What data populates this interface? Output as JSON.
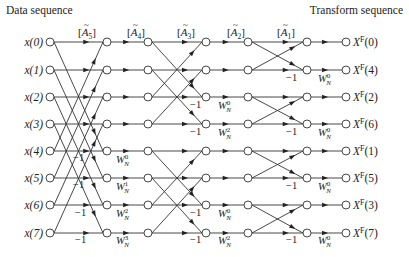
{
  "header": {
    "left_title": "Data sequence",
    "right_title": "Transform sequence"
  },
  "layout": {
    "columns_x": [
      50,
      107,
      148,
      206,
      248,
      307,
      346
    ],
    "rows_y": [
      42,
      70,
      97,
      124,
      151,
      178,
      205,
      233
    ],
    "node_radius": 4
  },
  "inputs": [
    "x(0)",
    "x(1)",
    "x(2)",
    "x(3)",
    "x(4)",
    "x(5)",
    "x(6)",
    "x(7)"
  ],
  "outputs": [
    {
      "base": "X",
      "sup": "F",
      "idx": "(0)"
    },
    {
      "base": "X",
      "sup": "F",
      "idx": "(4)"
    },
    {
      "base": "X",
      "sup": "F",
      "idx": "(2)"
    },
    {
      "base": "X",
      "sup": "F",
      "idx": "(6)"
    },
    {
      "base": "X",
      "sup": "F",
      "idx": "(1)"
    },
    {
      "base": "X",
      "sup": "F",
      "idx": "(5)"
    },
    {
      "base": "X",
      "sup": "F",
      "idx": "(3)"
    },
    {
      "base": "X",
      "sup": "F",
      "idx": "(7)"
    }
  ],
  "stage_labels": [
    {
      "text": "A",
      "sub": "5",
      "x": 78,
      "y": 36
    },
    {
      "text": "A",
      "sub": "4",
      "x": 127,
      "y": 36
    },
    {
      "text": "A",
      "sub": "3",
      "x": 177,
      "y": 36
    },
    {
      "text": "A",
      "sub": "2",
      "x": 227,
      "y": 36
    },
    {
      "text": "A",
      "sub": "1",
      "x": 277,
      "y": 36
    }
  ],
  "stages": [
    {
      "name": "stage-A5",
      "from_col": 0,
      "to_col": 1,
      "span": 4
    },
    {
      "name": "stage-A4",
      "from_col": 1,
      "to_col": 2,
      "span": 0
    },
    {
      "name": "stage-A3",
      "from_col": 2,
      "to_col": 3,
      "span": 2
    },
    {
      "name": "stage-A2",
      "from_col": 3,
      "to_col": 4,
      "span": 0
    },
    {
      "name": "stage-A1",
      "from_col": 4,
      "to_col": 5,
      "span": 1
    },
    {
      "name": "stage-out",
      "from_col": 5,
      "to_col": 6,
      "span": 0
    }
  ],
  "edge_labels": [
    {
      "text": "-1",
      "x": 73,
      "y": 161
    },
    {
      "text": "-1",
      "x": 73,
      "y": 188
    },
    {
      "text": "-1",
      "x": 75,
      "y": 216
    },
    {
      "text": "-1",
      "x": 75,
      "y": 243
    },
    {
      "text": "W",
      "sup": "0",
      "sub": "N",
      "x": 116,
      "y": 163
    },
    {
      "text": "W",
      "sup": "1",
      "sub": "N",
      "x": 116,
      "y": 190
    },
    {
      "text": "W",
      "sup": "2",
      "sub": "N",
      "x": 116,
      "y": 217
    },
    {
      "text": "W",
      "sup": "3",
      "sub": "N",
      "x": 116,
      "y": 244
    },
    {
      "text": "-1",
      "x": 190,
      "y": 108
    },
    {
      "text": "-1",
      "x": 190,
      "y": 135
    },
    {
      "text": "-1",
      "x": 190,
      "y": 216
    },
    {
      "text": "-1",
      "x": 190,
      "y": 243
    },
    {
      "text": "W",
      "sup": "0",
      "sub": "N",
      "x": 218,
      "y": 109
    },
    {
      "text": "W",
      "sup": "2",
      "sub": "N",
      "x": 218,
      "y": 136
    },
    {
      "text": "W",
      "sup": "0",
      "sub": "N",
      "x": 218,
      "y": 217
    },
    {
      "text": "W",
      "sup": "2",
      "sub": "N",
      "x": 218,
      "y": 244
    },
    {
      "text": "-1",
      "x": 286,
      "y": 81
    },
    {
      "text": "-1",
      "x": 286,
      "y": 135
    },
    {
      "text": "-1",
      "x": 286,
      "y": 189
    },
    {
      "text": "-1",
      "x": 286,
      "y": 243
    },
    {
      "text": "W",
      "sup": "0",
      "sub": "N",
      "x": 318,
      "y": 82
    },
    {
      "text": "W",
      "sup": "0",
      "sub": "N",
      "x": 318,
      "y": 136
    },
    {
      "text": "W",
      "sup": "0",
      "sub": "N",
      "x": 318,
      "y": 190
    },
    {
      "text": "W",
      "sup": "0",
      "sub": "N",
      "x": 318,
      "y": 244
    }
  ]
}
